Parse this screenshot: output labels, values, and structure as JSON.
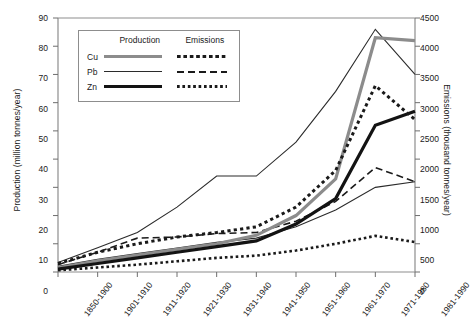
{
  "chart_data": {
    "type": "line",
    "title": "",
    "subtitle": "",
    "xlabel": "",
    "ylabel": "Production (million tonnes/year)",
    "ylabel_secondary": "Emissions (thousand tonnes/year)",
    "ylim": [
      0,
      90
    ],
    "ylim_secondary": [
      0,
      4500
    ],
    "ytick_step": 10,
    "ytick_step_secondary": 500,
    "grid": false,
    "legend_position": "upper-left-inside",
    "categories": [
      "1850-1900",
      "1901-1910",
      "1911-1920",
      "1921-1930",
      "1931-1940",
      "1941-1950",
      "1951-1960",
      "1961-1970",
      "1971-1980",
      "1981-1990"
    ],
    "yticks": [
      "0",
      "10",
      "20",
      "30",
      "40",
      "50",
      "60",
      "70",
      "80",
      "90"
    ],
    "yticks_secondary": [
      "0",
      "500",
      "1000",
      "1500",
      "2000",
      "2500",
      "3000",
      "3500",
      "4000",
      "4500"
    ],
    "series": [
      {
        "name": "Cu",
        "group": "Production",
        "axis": "left",
        "style": "solid-thick-gray",
        "color": "#8c8c8c",
        "values": [
          1.5,
          4.0,
          6.0,
          8.0,
          10.0,
          13.0,
          20.0,
          33.0,
          83.0,
          82.0
        ]
      },
      {
        "name": "Pb",
        "group": "Production",
        "axis": "left",
        "style": "solid-thin-black",
        "color": "#2b2b2b",
        "values": [
          2.0,
          4.5,
          6.5,
          8.5,
          10.5,
          12.0,
          16.0,
          22.0,
          30.0,
          32.0
        ]
      },
      {
        "name": "Zn",
        "group": "Production",
        "axis": "left",
        "style": "solid-thick-black",
        "color": "#131313",
        "values": [
          1.0,
          3.0,
          5.0,
          7.0,
          9.0,
          11.0,
          17.0,
          26.0,
          52.0,
          57.0
        ]
      },
      {
        "name": "Cu",
        "group": "Emissions",
        "axis": "right",
        "style": "dotted",
        "color": "#1a1a1a",
        "values": [
          150,
          350,
          500,
          620,
          700,
          800,
          1150,
          1800,
          3300,
          2700
        ]
      },
      {
        "name": "Pb",
        "group": "Emissions",
        "axis": "right",
        "style": "dashed",
        "color": "#1a1a1a",
        "values": [
          130,
          350,
          600,
          620,
          680,
          700,
          900,
          1250,
          1850,
          1600
        ]
      },
      {
        "name": "Zn",
        "group": "Emissions",
        "axis": "right",
        "style": "fine-dotted",
        "color": "#1a1a1a",
        "values": [
          30,
          80,
          130,
          190,
          250,
          290,
          380,
          500,
          640,
          530
        ]
      },
      {
        "name": "Pb-total",
        "group": "Emissions",
        "axis": "right",
        "style": "solid-thin-black",
        "color": "#2b2b2b",
        "values": [
          170,
          430,
          700,
          1150,
          1700,
          1700,
          2300,
          3200,
          4300,
          3500
        ]
      }
    ],
    "legend": {
      "col_production": "Production",
      "col_emissions": "Emissions",
      "rows": [
        {
          "key": "Cu"
        },
        {
          "key": "Pb"
        },
        {
          "key": "Zn"
        }
      ]
    }
  }
}
